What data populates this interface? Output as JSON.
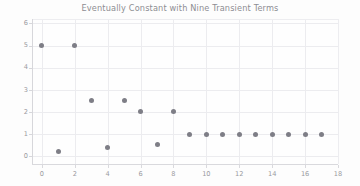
{
  "chart_data": {
    "type": "scatter",
    "title": "Eventually Constant with Nine Transient Terms",
    "xlabel": "",
    "ylabel": "",
    "xlim": [
      -0.6,
      18.0
    ],
    "ylim": [
      -0.35,
      6.2
    ],
    "xticks": [
      0,
      2,
      4,
      6,
      8,
      10,
      12,
      14,
      16,
      18
    ],
    "xtick_labels": [
      "0",
      "2",
      "4",
      "6",
      "8",
      "10",
      "12",
      "14",
      "16",
      "18"
    ],
    "yticks": [
      0,
      1,
      2,
      3,
      4,
      5,
      6
    ],
    "ytick_labels": [
      "0",
      "1",
      "2",
      "3",
      "4",
      "5",
      "6"
    ],
    "grid": true,
    "legend": false,
    "marker_color": "#7e7e86",
    "grid_color": "#ececef",
    "tick_label_color": "#9a9aa0",
    "title_color": "#8d8d93",
    "x": [
      0,
      1,
      2,
      3,
      4,
      5,
      6,
      7,
      8,
      9,
      10,
      11,
      12,
      13,
      14,
      15,
      16,
      17
    ],
    "y": [
      5,
      0.2,
      5,
      2.5,
      0.4,
      2.5,
      2,
      0.55,
      2,
      1,
      1,
      1,
      1,
      1,
      1,
      1,
      1,
      1
    ],
    "points": [
      {
        "x": 0,
        "y": 5
      },
      {
        "x": 1,
        "y": 0.2
      },
      {
        "x": 2,
        "y": 5
      },
      {
        "x": 3,
        "y": 2.5
      },
      {
        "x": 4,
        "y": 0.4
      },
      {
        "x": 5,
        "y": 2.5
      },
      {
        "x": 6,
        "y": 2
      },
      {
        "x": 7,
        "y": 0.55
      },
      {
        "x": 8,
        "y": 2
      },
      {
        "x": 9,
        "y": 1
      },
      {
        "x": 10,
        "y": 1
      },
      {
        "x": 11,
        "y": 1
      },
      {
        "x": 12,
        "y": 1
      },
      {
        "x": 13,
        "y": 1
      },
      {
        "x": 14,
        "y": 1
      },
      {
        "x": 15,
        "y": 1
      },
      {
        "x": 16,
        "y": 1
      },
      {
        "x": 17,
        "y": 1
      }
    ],
    "transient_count": 9,
    "eventual_constant_value": 1
  }
}
